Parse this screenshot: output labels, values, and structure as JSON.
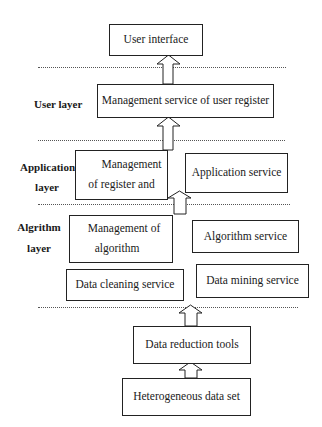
{
  "layers": {
    "user": "User layer",
    "application_line1": "Application",
    "application_line2": "layer",
    "algorithm_line1": "Algrithm",
    "algorithm_line2": "layer"
  },
  "boxes": {
    "user_interface": "User interface",
    "mgmt_user_register": "Management service of user register",
    "mgmt_register_line1": "Management",
    "mgmt_register_line2": "of register and",
    "application_service": "Application service",
    "mgmt_algorithm_line1": "Management of",
    "mgmt_algorithm_line2": "algorithm",
    "algorithm_service": "Algorithm service",
    "data_cleaning": "Data cleaning service",
    "data_mining": "Data mining service",
    "data_reduction": "Data reduction tools",
    "heterogeneous": "Heterogeneous data set"
  }
}
